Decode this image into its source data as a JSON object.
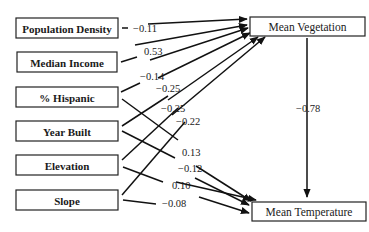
{
  "diagram": {
    "type": "path-diagram",
    "predictors": [
      {
        "id": "pop",
        "label": "Population Density"
      },
      {
        "id": "inc",
        "label": "Median Income"
      },
      {
        "id": "hisp",
        "label": "% Hispanic"
      },
      {
        "id": "year",
        "label": "Year Built"
      },
      {
        "id": "elev",
        "label": "Elevation"
      },
      {
        "id": "slope",
        "label": "Slope"
      }
    ],
    "outcomes": [
      {
        "id": "veg",
        "label": "Mean Vegetation"
      },
      {
        "id": "temp",
        "label": "Mean Temperature"
      }
    ],
    "paths": [
      {
        "from": "pop",
        "to": "veg",
        "coef": "−0.11"
      },
      {
        "from": "inc",
        "to": "veg",
        "coef": "0.53"
      },
      {
        "from": "hisp",
        "to": "veg",
        "coef": "−0.14"
      },
      {
        "from": "year",
        "to": "veg",
        "coef": "−0.25"
      },
      {
        "from": "elev",
        "to": "veg",
        "coef": "−0.25"
      },
      {
        "from": "slope",
        "to": "veg",
        "coef": "−0.22"
      },
      {
        "from": "hisp",
        "to": "temp",
        "coef": "0.13"
      },
      {
        "from": "year",
        "to": "temp",
        "coef": "−0.12"
      },
      {
        "from": "elev",
        "to": "temp",
        "coef": "0.10"
      },
      {
        "from": "slope",
        "to": "temp",
        "coef": "−0.08"
      },
      {
        "from": "veg",
        "to": "temp",
        "coef": "−0.78"
      }
    ]
  }
}
